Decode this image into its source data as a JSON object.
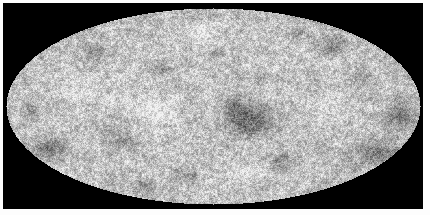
{
  "figure": {
    "kind": "all-sky-map",
    "projection": "Mollweide",
    "title": "",
    "caption": "",
    "colormap": "grayscale",
    "background_color": "#000000",
    "page_color": "#fdfdfd"
  },
  "chart_data": {
    "type": "heatmap",
    "title": "",
    "subtitle": "",
    "xlabel": "",
    "ylabel": "",
    "projection": "Mollweide",
    "grid": false,
    "legend": "none",
    "colorbar": false,
    "colormap": "grayscale",
    "color_low": "#111111",
    "color_mid": "#c6c6c6",
    "color_high": "#f4f4f4",
    "value_range": [
      0,
      1
    ],
    "mean_level": 0.78,
    "noise_amplitude": 0.26,
    "ellipse": {
      "center_x": 213,
      "center_y": 106,
      "semi_axis_x": 207,
      "semi_axis_y": 98
    },
    "field": {
      "grain_px": 1.35,
      "seed": 20130321,
      "octaves": [
        {
          "scale": 1.6,
          "weight": 0.52
        },
        {
          "scale": 4.0,
          "weight": 0.26
        },
        {
          "scale": 9.0,
          "weight": 0.14
        },
        {
          "scale": 20.0,
          "weight": 0.08
        }
      ]
    },
    "cold_spots": [
      {
        "x": 247,
        "y": 120,
        "rx": 26,
        "ry": 17,
        "depth": 0.42
      },
      {
        "x": 231,
        "y": 106,
        "rx": 14,
        "ry": 10,
        "depth": 0.22
      },
      {
        "x": 51,
        "y": 148,
        "rx": 19,
        "ry": 12,
        "depth": 0.36
      },
      {
        "x": 402,
        "y": 115,
        "rx": 17,
        "ry": 14,
        "depth": 0.34
      },
      {
        "x": 374,
        "y": 152,
        "rx": 24,
        "ry": 13,
        "depth": 0.3
      },
      {
        "x": 331,
        "y": 45,
        "rx": 17,
        "ry": 11,
        "depth": 0.26
      },
      {
        "x": 296,
        "y": 32,
        "rx": 13,
        "ry": 8,
        "depth": 0.2
      },
      {
        "x": 360,
        "y": 76,
        "rx": 12,
        "ry": 9,
        "depth": 0.18
      },
      {
        "x": 187,
        "y": 174,
        "rx": 14,
        "ry": 9,
        "depth": 0.2
      },
      {
        "x": 121,
        "y": 141,
        "rx": 16,
        "ry": 10,
        "depth": 0.22
      },
      {
        "x": 96,
        "y": 52,
        "rx": 14,
        "ry": 10,
        "depth": 0.2
      },
      {
        "x": 160,
        "y": 66,
        "rx": 12,
        "ry": 9,
        "depth": 0.16
      },
      {
        "x": 280,
        "y": 160,
        "rx": 15,
        "ry": 10,
        "depth": 0.22
      },
      {
        "x": 214,
        "y": 52,
        "rx": 11,
        "ry": 8,
        "depth": 0.15
      },
      {
        "x": 413,
        "y": 145,
        "rx": 11,
        "ry": 9,
        "depth": 0.24
      },
      {
        "x": 30,
        "y": 112,
        "rx": 10,
        "ry": 9,
        "depth": 0.18
      },
      {
        "x": 144,
        "y": 186,
        "rx": 13,
        "ry": 7,
        "depth": 0.18
      },
      {
        "x": 259,
        "y": 77,
        "rx": 10,
        "ry": 7,
        "depth": 0.14
      }
    ],
    "hot_spots": [
      {
        "x": 150,
        "y": 110,
        "rx": 24,
        "ry": 16,
        "lift": 0.16
      },
      {
        "x": 320,
        "y": 110,
        "rx": 20,
        "ry": 15,
        "lift": 0.13
      },
      {
        "x": 80,
        "y": 90,
        "rx": 20,
        "ry": 14,
        "lift": 0.12
      },
      {
        "x": 244,
        "y": 172,
        "rx": 18,
        "ry": 11,
        "lift": 0.11
      },
      {
        "x": 200,
        "y": 30,
        "rx": 18,
        "ry": 10,
        "lift": 0.1
      },
      {
        "x": 60,
        "y": 175,
        "rx": 14,
        "ry": 9,
        "lift": 0.1
      }
    ]
  }
}
